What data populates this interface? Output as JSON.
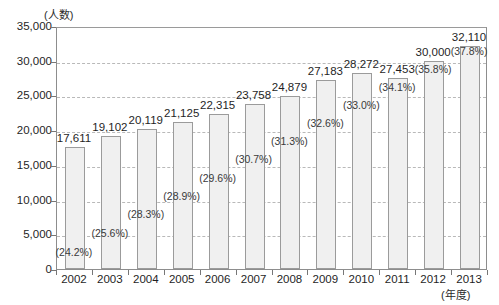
{
  "chart_data": {
    "type": "bar",
    "title": "",
    "xlabel": "(年度)",
    "ylabel": "(人数)",
    "ylim": [
      0,
      35000
    ],
    "ytick_labels": [
      "35,000",
      "30,000",
      "25,000",
      "20,000",
      "15,000",
      "10,000",
      "5,000",
      "0"
    ],
    "ytick_values": [
      35000,
      30000,
      25000,
      20000,
      15000,
      10000,
      5000,
      0
    ],
    "grid": true,
    "legend": "none",
    "categories": [
      "2002",
      "2003",
      "2004",
      "2005",
      "2006",
      "2007",
      "2008",
      "2009",
      "2010",
      "2011",
      "2012",
      "2013"
    ],
    "values": [
      17611,
      19102,
      20119,
      21125,
      22315,
      23758,
      24879,
      27183,
      28272,
      27453,
      30000,
      32110
    ],
    "value_labels": [
      "17,611",
      "19,102",
      "20,119",
      "21,125",
      "22,315",
      "23,758",
      "24,879",
      "27,183",
      "28,272",
      "27,453",
      "30,000",
      "32,110"
    ],
    "percent_values": [
      24.2,
      25.6,
      28.3,
      28.9,
      29.6,
      30.7,
      31.3,
      32.6,
      33.0,
      34.1,
      35.8,
      37.8
    ],
    "percent_labels": [
      "(24.2%)",
      "(25.6%)",
      "(28.3%)",
      "(28.9%)",
      "(29.6%)",
      "(30.7%)",
      "(31.3%)",
      "(32.6%)",
      "(33.0%)",
      "(34.1%)",
      "(35.8%)",
      "(37.8%)"
    ],
    "colors": {
      "bar_fill": "#f0f0f0",
      "bar_stroke": "#9b9b9b",
      "grid": "#b9b9b9",
      "axis": "#8d8d8d",
      "text": "#1f1f1f"
    }
  }
}
